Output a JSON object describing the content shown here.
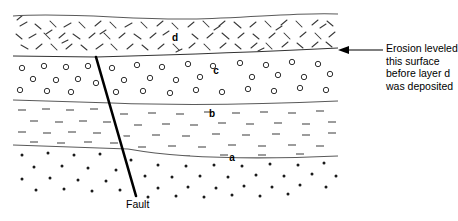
{
  "figure": {
    "background_color": "#ffffff",
    "line_color": "#555555",
    "fault_color": "#000000",
    "text_color": "#000000"
  },
  "layers": [
    {
      "id": "d",
      "label": "d",
      "label_x": 175,
      "label_y": 41,
      "pattern": "angled-dashes",
      "description": "Topmost unit deposited after erosion"
    },
    {
      "id": "c",
      "label": "c",
      "label_x": 216,
      "label_y": 74,
      "pattern": "open-circles",
      "description": "Conglomerate unit offset by fault"
    },
    {
      "id": "b",
      "label": "b",
      "label_x": 212,
      "label_y": 117,
      "pattern": "horizontal-dashes",
      "description": "Siltstone unit offset by fault"
    },
    {
      "id": "a",
      "label": "a",
      "label_x": 232,
      "label_y": 161,
      "pattern": "dots",
      "description": "Lowest sandstone unit cut by fault"
    }
  ],
  "fault": {
    "label": "Fault",
    "x1": 96,
    "y1": 57,
    "x2": 136,
    "y2": 196,
    "stroke_width": 2.6,
    "note": "Fault terminates upward at the erosion surface"
  },
  "annotation": {
    "lines": [
      "Erosion leveled",
      "this surface",
      "before layer d",
      "was deposited"
    ],
    "arrow": {
      "from_x": 383,
      "to_x": 340,
      "y": 50,
      "direction": "left",
      "target": "erosion-surface"
    }
  }
}
